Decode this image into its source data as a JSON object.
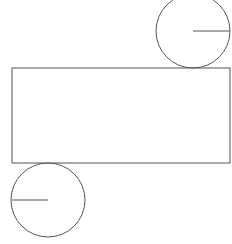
{
  "diagram": {
    "type": "cylinder-net",
    "stroke_color": "#555555",
    "background": "#ffffff",
    "rectangle": {
      "x": 12,
      "y": 68,
      "width": 218,
      "height": 95
    },
    "top_circle": {
      "cx": 193,
      "cy": 31,
      "r": 37,
      "radius_line": {
        "x1": 193,
        "y1": 31,
        "x2": 230,
        "y2": 31
      }
    },
    "bottom_circle": {
      "cx": 48,
      "cy": 200,
      "r": 37,
      "radius_line": {
        "x1": 12,
        "y1": 200,
        "x2": 48,
        "y2": 200
      }
    }
  }
}
